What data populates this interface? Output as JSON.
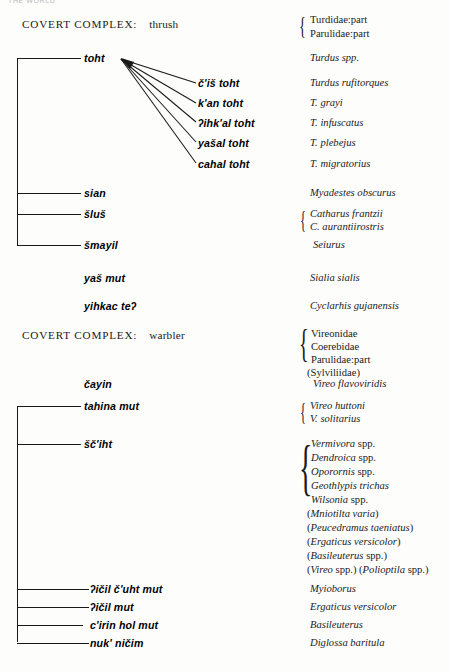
{
  "page": {
    "running_head": "THE WORLD",
    "width": 450,
    "height": 671,
    "ink_color": "#191919"
  },
  "sections": [
    {
      "id": "thrush",
      "header_label": "COVERT COMPLEX:",
      "header_name": "thrush",
      "header_families": [
        "Turdidae:part",
        "Parulidae:part"
      ]
    },
    {
      "id": "warbler",
      "header_label": "COVERT COMPLEX:",
      "header_name": "warbler",
      "header_families": [
        "Vireonidae",
        "Coerebidae",
        "Parulidae:part"
      ],
      "header_extra": [
        "(Sylviliidae)"
      ]
    }
  ],
  "taxa": {
    "toht": "toht",
    "cis_toht": "č'iš toht",
    "kan_toht": "k'an toht",
    "ihkal_toht": "ʔihk'al toht",
    "yasal_toht": "yašal toht",
    "cahal_toht": "cahal toht",
    "sian": "sian",
    "slus": "šluš",
    "smayil": "šmayil",
    "yas_mut": "yaš mut",
    "yihkac_te": "yihkac teʔ",
    "cayin": "čayin",
    "tahina_mut": "tahina mut",
    "sciht": "šč'iht",
    "icil_cuht_mut": "ʔičil č'uht mut",
    "icil_mut": "ʔičil mut",
    "cirin_hol_mut": "c'irin hol mut",
    "nuk_nicim": "nuk' ničim"
  },
  "scientific": {
    "turdus_spp": "Turdus spp.",
    "turdus_rufitorques": "Turdus rufitorques",
    "t_grayi": "T. grayi",
    "t_infuscatus": "T. infuscatus",
    "t_plebejus": "T. plebejus",
    "t_migratorius": "T. migratorius",
    "myadestes_obscurus": "Myadestes obscurus",
    "catharus_frantzii": "Catharus frantzii",
    "c_aurantiirostris": "C. aurantiirostris",
    "seiurus": "Seiurus",
    "sialia_sialis": "Sialia sialis",
    "cyclarhis_gujanensis": "Cyclarhis gujanensis",
    "vireo_flavoviridis": "Vireo flavoviridis",
    "vireo_huttoni": "Vireo huttoni",
    "v_solitarius": "V. solitarius",
    "myioborus": "Myioborus",
    "ergaticus_versicolor": "Ergaticus versicolor",
    "basileuterus": "Basileuterus",
    "diglossa_baritula": "Diglossa baritula"
  },
  "sciht_list": {
    "braced": [
      {
        "genus": "Vermivora",
        "qualifier": " spp."
      },
      {
        "genus": "Dendroica",
        "qualifier": " spp."
      },
      {
        "genus": "Oporornis",
        "qualifier": " spp."
      },
      {
        "genus": "Geothlypis trichas",
        "qualifier": ""
      },
      {
        "genus": "Wilsonia",
        "qualifier": " spp."
      }
    ],
    "parenthetical": [
      {
        "open": "(",
        "genus": "Mniotilta varia",
        "close": ")"
      },
      {
        "open": "(",
        "genus": "Peucedramus taeniatus",
        "close": ")"
      },
      {
        "open": "(",
        "genus": "Ergaticus versicolor",
        "close": ")"
      },
      {
        "open": "(",
        "genus": "Basileuterus",
        "mid": " spp.)",
        "close": ""
      },
      {
        "open": "(",
        "genus": "Vireo",
        "mid": " spp.) (",
        "genus2": "Polioptila",
        "close": " spp.)"
      }
    ]
  },
  "braces": {
    "thrush_families": "{",
    "catharus": "{",
    "warbler_families": "{",
    "vireo_pair": "{",
    "sciht": "{"
  }
}
